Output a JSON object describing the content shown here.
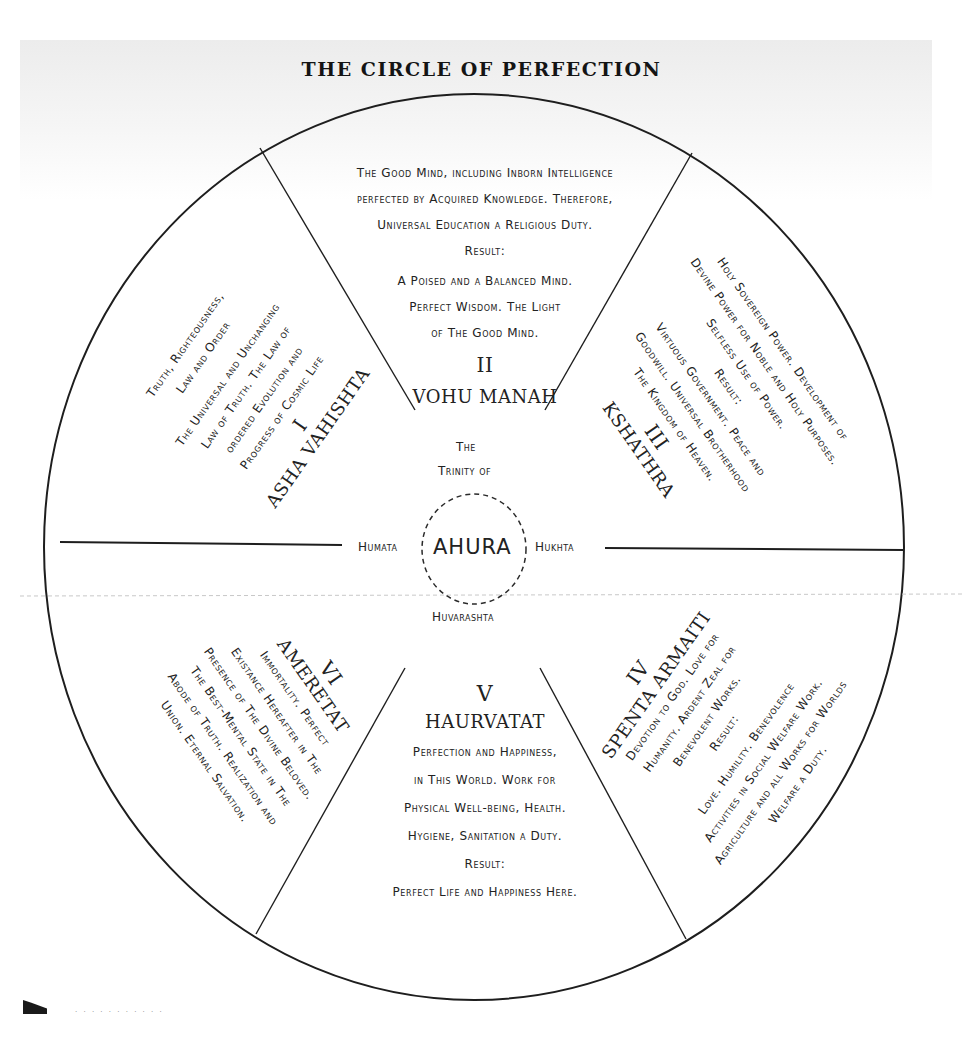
{
  "title": "THE CIRCLE OF PERFECTION",
  "center": {
    "header_line1": "The",
    "header_line2": "Trinity of",
    "name": "AHURA",
    "left": "Humata",
    "right": "Hukhta",
    "bottom": "Huvarashta"
  },
  "segments": [
    {
      "numeral": "I",
      "name": "Asha Vahishta",
      "lines": [
        "Truth, Righteousness,",
        "Law and Order",
        "The Universal and Unchanging",
        "Law of Truth. The Law of",
        "ordered Evolution and",
        "Progress of Cosmic Life"
      ]
    },
    {
      "numeral": "II",
      "name": "Vohu Manah",
      "lines": [
        "The Good Mind, including Inborn Intelligence",
        "perfected by Acquired Knowledge. Therefore,",
        "Universal Education a Religious Duty.",
        "Result:",
        "A Poised and a Balanced Mind.",
        "Perfect Wisdom. The Light",
        "of The Good Mind."
      ]
    },
    {
      "numeral": "III",
      "name": "Kshathra",
      "lines": [
        "Holy Sovereign Power. Development of",
        "Devine Power for Noble and Holy Purposes.",
        "Selfless Use of Power.",
        "Result:",
        "Virtuous Government. Peace and",
        "Goodwill. Universal Brotherhood",
        "The Kingdom of Heaven."
      ]
    },
    {
      "numeral": "IV",
      "name": "Spenta Armaiti",
      "lines": [
        "Devotion to God. Love for",
        "Humanity. Ardent Zeal for",
        "Benevolent Works.",
        "Result:",
        "Love. Humility. Benevolence",
        "Activities in Social Welfare Work.",
        "Agriculture and all Works for Worlds",
        "Welfare a Duty."
      ]
    },
    {
      "numeral": "V",
      "name": "Haurvatat",
      "lines": [
        "Perfection and Happiness,",
        "in This World. Work for",
        "Physical Well-being, Health.",
        "Hygiene, Sanitation a Duty.",
        "Result:",
        "Perfect Life and Happiness Here."
      ]
    },
    {
      "numeral": "VI",
      "name": "Ameretat",
      "lines": [
        "Immortality. Perfect",
        "Existance Hereafter in The",
        "Presence of The Divine Beloved.",
        "The Best-Mental State in The",
        "Abode of Truth. Realization and",
        "Union. Eternal Salvation."
      ]
    }
  ],
  "colors": {
    "ink": "#1e1e1e",
    "paper": "#ffffff",
    "header_tint": "#ececec"
  }
}
